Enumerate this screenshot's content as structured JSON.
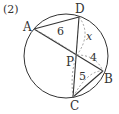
{
  "problem_number": "(2)",
  "points": {
    "A": {
      "label": "A",
      "x": 34,
      "y": 29
    },
    "D": {
      "label": "D",
      "x": 79,
      "y": 17
    },
    "P": {
      "label": "P",
      "x": 77,
      "y": 55
    },
    "B": {
      "label": "B",
      "x": 103,
      "y": 71
    },
    "C": {
      "label": "C",
      "x": 73,
      "y": 97
    }
  },
  "circle": {
    "cx": 66,
    "cy": 56,
    "r": 42
  },
  "measurements": {
    "AP": "6",
    "DP": "x",
    "PB": "4",
    "PC": "5"
  },
  "colors": {
    "stroke": "#333333",
    "dashed": "#888888"
  }
}
